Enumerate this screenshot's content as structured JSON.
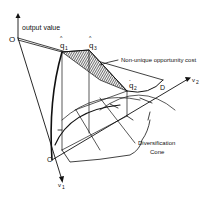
{
  "diagram": {
    "axes": {
      "vertical_label": "output value",
      "x1_label": "v",
      "x1_sub": "1",
      "x2_label": "v",
      "x2_sub": "2"
    },
    "points": {
      "origin": "O",
      "q1": "q",
      "q1_sub": "1",
      "q1_hat": "^",
      "q3": "q",
      "q3_sub": "3",
      "q3_hat": "^",
      "q2": "q",
      "q2_sub": "2",
      "q2_bar": "-",
      "C": "C",
      "D": "D"
    },
    "annotations": {
      "non_unique": "Non-unique opportunity cost",
      "cone_line1": "Diversification",
      "cone_line2": "Cone"
    },
    "colors": {
      "ink": "#111111",
      "background": "#ffffff"
    }
  }
}
